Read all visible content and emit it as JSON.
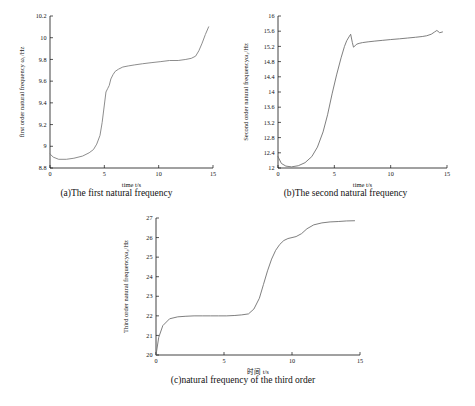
{
  "figure": {
    "panels": [
      {
        "id": "panel-a",
        "caption": "(a)The first natural frequency",
        "chart_key": 0
      },
      {
        "id": "panel-b",
        "caption": "(b)The second natural frequency",
        "chart_key": 1
      },
      {
        "id": "panel-c",
        "caption": "(c)natural frequency of the third order",
        "chart_key": 2
      }
    ]
  },
  "chart_data": [
    {
      "type": "line",
      "title": "",
      "xlabel": "time t/s",
      "ylabel": "first order natural frequency ω₁/Hz",
      "xlim": [
        0,
        15
      ],
      "ylim": [
        8.8,
        10.2
      ],
      "xticks": [
        0,
        5,
        10,
        15
      ],
      "xtick_labels": [
        "0",
        "5",
        "10",
        "15"
      ],
      "yticks": [
        8.8,
        9.0,
        9.2,
        9.4,
        9.6,
        9.8,
        10.0,
        10.2
      ],
      "ytick_labels": [
        "8.8",
        "9",
        "9.2",
        "9.4",
        "9.6",
        "9.8",
        "10",
        "10.2"
      ],
      "grid": false,
      "legend": "none",
      "line_color": "#808080",
      "series": [
        {
          "name": "first order natural frequency",
          "x": [
            0.0,
            0.3,
            0.8,
            1.5,
            2.2,
            3.0,
            3.6,
            4.0,
            4.3,
            4.6,
            4.8,
            5.0,
            5.15,
            5.3,
            5.45,
            5.6,
            5.8,
            6.0,
            6.3,
            6.7,
            7.2,
            7.8,
            8.5,
            9.3,
            10.2,
            11.0,
            11.8,
            12.5,
            13.0,
            13.4,
            13.7,
            14.0,
            14.3,
            14.6
          ],
          "y": [
            8.93,
            8.9,
            8.88,
            8.88,
            8.89,
            8.91,
            8.94,
            8.97,
            9.02,
            9.1,
            9.22,
            9.38,
            9.5,
            9.53,
            9.56,
            9.62,
            9.66,
            9.69,
            9.71,
            9.73,
            9.74,
            9.75,
            9.76,
            9.77,
            9.78,
            9.79,
            9.79,
            9.8,
            9.81,
            9.83,
            9.88,
            9.95,
            10.03,
            10.1
          ]
        }
      ]
    },
    {
      "type": "line",
      "title": "",
      "xlabel": "time t/s",
      "ylabel": "Second order natural frequencyω₂/Hz",
      "xlim": [
        0,
        15
      ],
      "ylim": [
        12.0,
        16.0
      ],
      "xticks": [
        0,
        5,
        10,
        15
      ],
      "xtick_labels": [
        "0",
        "5",
        "10",
        "15"
      ],
      "yticks": [
        12.0,
        12.4,
        12.8,
        13.2,
        13.6,
        14.0,
        14.4,
        14.8,
        15.2,
        15.6,
        16.0
      ],
      "ytick_labels": [
        "12",
        "12.4",
        "12.8",
        "13.2",
        "13.6",
        "14",
        "14.4",
        "14.8",
        "15.2",
        "15.6",
        "16"
      ],
      "grid": false,
      "legend": "none",
      "line_color": "#707070",
      "series": [
        {
          "name": "second order natural frequency",
          "x": [
            0.0,
            0.3,
            0.7,
            1.2,
            1.8,
            2.4,
            3.0,
            3.5,
            4.0,
            4.4,
            4.8,
            5.2,
            5.6,
            5.9,
            6.1,
            6.3,
            6.45,
            6.6,
            6.7,
            6.85,
            7.0,
            7.2,
            7.5,
            8.0,
            8.6,
            9.3,
            10.0,
            10.8,
            11.5,
            12.2,
            12.8,
            13.2,
            13.6,
            13.9,
            14.1,
            14.35,
            14.6
          ],
          "y": [
            12.3,
            12.12,
            12.05,
            12.03,
            12.06,
            12.14,
            12.3,
            12.55,
            12.95,
            13.4,
            13.95,
            14.45,
            14.9,
            15.2,
            15.35,
            15.45,
            15.52,
            15.3,
            15.18,
            15.22,
            15.26,
            15.28,
            15.3,
            15.32,
            15.34,
            15.36,
            15.38,
            15.4,
            15.42,
            15.44,
            15.46,
            15.48,
            15.52,
            15.58,
            15.62,
            15.56,
            15.58
          ]
        }
      ]
    },
    {
      "type": "line",
      "title": "",
      "xlabel": "时间 t/s",
      "ylabel": "Third order natural frequencyω₃/Hz",
      "xlim": [
        0,
        15
      ],
      "ylim": [
        20,
        27
      ],
      "xticks": [
        0,
        5,
        10,
        15
      ],
      "xtick_labels": [
        "0",
        "5",
        "10",
        "15"
      ],
      "yticks": [
        20,
        21,
        22,
        23,
        24,
        25,
        26,
        27
      ],
      "ytick_labels": [
        "20",
        "21",
        "22",
        "23",
        "24",
        "25",
        "26",
        "27"
      ],
      "grid": false,
      "legend": "none",
      "line_color": "#707070",
      "series": [
        {
          "name": "third order natural frequency",
          "x": [
            0.0,
            0.2,
            0.5,
            1.0,
            1.6,
            2.2,
            2.8,
            3.4,
            4.0,
            4.6,
            5.2,
            5.8,
            6.3,
            6.8,
            7.2,
            7.6,
            7.9,
            8.2,
            8.5,
            8.8,
            9.1,
            9.4,
            9.7,
            10.0,
            10.3,
            10.7,
            11.1,
            11.6,
            12.2,
            12.8,
            13.4,
            14.0,
            14.6
          ],
          "y": [
            20.0,
            20.9,
            21.5,
            21.85,
            21.95,
            21.98,
            22.0,
            22.0,
            22.0,
            22.0,
            22.0,
            22.02,
            22.05,
            22.1,
            22.35,
            22.9,
            23.6,
            24.3,
            24.9,
            25.35,
            25.65,
            25.85,
            25.95,
            26.0,
            26.05,
            26.2,
            26.45,
            26.65,
            26.75,
            26.8,
            26.82,
            26.85,
            26.86
          ]
        }
      ]
    }
  ]
}
